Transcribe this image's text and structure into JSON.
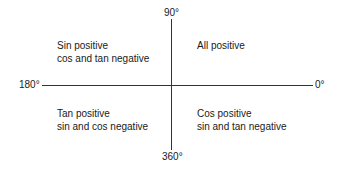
{
  "diagram": {
    "type": "trigonometric-quadrant-sign-diagram",
    "axes": {
      "top": "90°",
      "bottom": "360°",
      "left": "180°",
      "right": "0°"
    },
    "quadrants": {
      "top_left": {
        "line1": "Sin positive",
        "line2": "cos and tan negative"
      },
      "top_right": {
        "line1": "All positive"
      },
      "bottom_left": {
        "line1": "Tan positive",
        "line2": "sin and cos negative"
      },
      "bottom_right": {
        "line1": "Cos positive",
        "line2": "sin and tan negative"
      }
    },
    "colors": {
      "text": "#1a1a1a",
      "axis": "#333333",
      "background": "#ffffff"
    }
  }
}
